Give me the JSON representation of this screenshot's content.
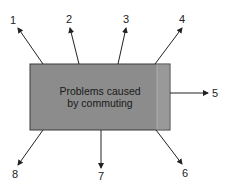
{
  "diagram": {
    "center": {
      "line1": "Problems caused",
      "line2": "by commuting",
      "fill": "#8c8c8c",
      "border": "#3a3a3a"
    },
    "arrows": [
      {
        "label": "1"
      },
      {
        "label": "2"
      },
      {
        "label": "3"
      },
      {
        "label": "4"
      },
      {
        "label": "5"
      },
      {
        "label": "6"
      },
      {
        "label": "7"
      },
      {
        "label": "8"
      }
    ]
  }
}
